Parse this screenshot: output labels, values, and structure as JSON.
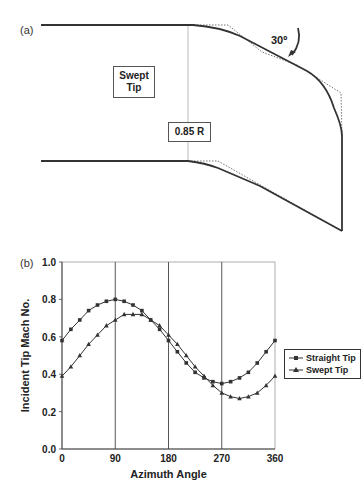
{
  "diagram_a": {
    "panel_label": "(a)",
    "title_box": "Swept Tip",
    "title_box_lines": [
      "Swept",
      "Tip"
    ],
    "station_label": "0.85 R",
    "sweep_angle_label": "30º"
  },
  "chart_b": {
    "panel_label": "(b)"
  },
  "chart_data": {
    "type": "line",
    "title": "",
    "xlabel": "Azimuth Angle",
    "ylabel": "Incident Tip Mach No.",
    "xlim": [
      0,
      360
    ],
    "ylim": [
      0.0,
      1.0
    ],
    "xticks": [
      "0",
      "90",
      "180",
      "270",
      "360"
    ],
    "yticks": [
      "0.0",
      "0.2",
      "0.4",
      "0.6",
      "0.8",
      "1.0"
    ],
    "grid": "vertical lines at 90, 180, 270",
    "legend_position": "right",
    "x": [
      0,
      15,
      30,
      45,
      60,
      75,
      90,
      105,
      120,
      135,
      150,
      165,
      180,
      195,
      210,
      225,
      240,
      255,
      270,
      285,
      300,
      315,
      330,
      345,
      360
    ],
    "series": [
      {
        "name": "Straight Tip",
        "marker": "square",
        "values": [
          0.58,
          0.64,
          0.69,
          0.74,
          0.77,
          0.79,
          0.8,
          0.79,
          0.77,
          0.74,
          0.69,
          0.64,
          0.58,
          0.52,
          0.46,
          0.41,
          0.38,
          0.36,
          0.35,
          0.36,
          0.38,
          0.41,
          0.46,
          0.52,
          0.58
        ]
      },
      {
        "name": "Swept Tip",
        "marker": "triangle",
        "values": [
          0.39,
          0.44,
          0.5,
          0.56,
          0.61,
          0.66,
          0.69,
          0.72,
          0.72,
          0.72,
          0.69,
          0.66,
          0.61,
          0.56,
          0.5,
          0.44,
          0.39,
          0.34,
          0.3,
          0.28,
          0.27,
          0.28,
          0.3,
          0.34,
          0.39
        ]
      }
    ]
  }
}
